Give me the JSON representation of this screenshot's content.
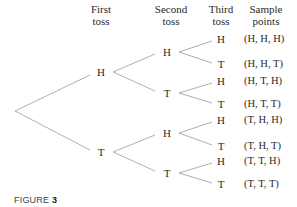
{
  "headers": {
    "first_toss": [
      "First",
      "toss"
    ],
    "second_toss": [
      "Second",
      "toss"
    ],
    "third_toss": [
      "Third",
      "toss"
    ],
    "sample_points": [
      "Sample",
      "points"
    ]
  },
  "first_toss": [
    {
      "label": "H",
      "x": 101,
      "y": 72
    },
    {
      "label": "T",
      "x": 101,
      "y": 152
    }
  ],
  "second_toss": [
    {
      "label": "H",
      "x": 167,
      "y": 52
    },
    {
      "label": "T",
      "x": 167,
      "y": 93
    },
    {
      "label": "H",
      "x": 167,
      "y": 133
    },
    {
      "label": "T",
      "x": 167,
      "y": 173
    }
  ],
  "third_toss": [
    {
      "label": "H",
      "y": 39
    },
    {
      "label": "T",
      "y": 64
    },
    {
      "label": "H",
      "y": 81
    },
    {
      "label": "T",
      "y": 104
    },
    {
      "label": "H",
      "y": 120
    },
    {
      "label": "T",
      "y": 146
    },
    {
      "label": "H",
      "y": 161
    },
    {
      "label": "T",
      "y": 184
    }
  ],
  "sample_points": [
    "(H, H, H)",
    "(H, H, T)",
    "(H, T, H)",
    "(H, T, T)",
    "(T, H, H)",
    "(T, H, T)",
    "(T, T, H)",
    "(T, T, T)"
  ],
  "caption": {
    "prefix": "FIGURE ",
    "number": "3"
  },
  "colors": {
    "line": "#b0b0b0",
    "text": "#2a2a2a"
  }
}
